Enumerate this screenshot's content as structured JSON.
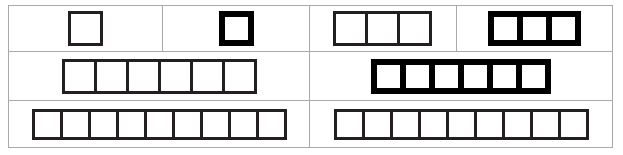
{
  "figure": {
    "background_color": "#ffffff",
    "frame_color": "#a9a9a9",
    "stroke_thin_color": "#231f20",
    "stroke_thick_color": "#000000"
  },
  "rows": [
    {
      "row_label": "row-1",
      "cells": [
        {
          "cell_label": "row1-cell1",
          "square_count": 1,
          "stroke": "thin",
          "size": "size-lg",
          "squares": [
            "1"
          ]
        },
        {
          "cell_label": "row1-cell2",
          "square_count": 1,
          "stroke": "thick",
          "size": "size-lg",
          "squares": [
            "1"
          ]
        },
        {
          "cell_label": "row1-cell3",
          "square_count": 3,
          "stroke": "thin",
          "size": "size-md",
          "squares": [
            "1",
            "2",
            "3"
          ]
        },
        {
          "cell_label": "row1-cell4",
          "square_count": 3,
          "stroke": "thick",
          "size": "size-md",
          "squares": [
            "1",
            "2",
            "3"
          ]
        }
      ]
    },
    {
      "row_label": "row-2",
      "cells": [
        {
          "cell_label": "row2-cell1",
          "square_count": 6,
          "stroke": "thin",
          "size": "size-md",
          "squares": [
            "1",
            "2",
            "3",
            "4",
            "5",
            "6"
          ]
        },
        {
          "cell_label": "row2-cell2",
          "square_count": 6,
          "stroke": "thick",
          "size": "size-md",
          "squares": [
            "1",
            "2",
            "3",
            "4",
            "5",
            "6"
          ]
        }
      ]
    },
    {
      "row_label": "row-3",
      "cells": [
        {
          "cell_label": "row3-cell1",
          "square_count": 9,
          "stroke": "thin",
          "size": "size-sm",
          "squares": [
            "1",
            "2",
            "3",
            "4",
            "5",
            "6",
            "7",
            "8",
            "9"
          ]
        },
        {
          "cell_label": "row3-cell2",
          "square_count": 9,
          "stroke": "thin",
          "size": "size-sm",
          "squares": [
            "1",
            "2",
            "3",
            "4",
            "5",
            "6",
            "7",
            "8",
            "9"
          ]
        }
      ]
    }
  ]
}
